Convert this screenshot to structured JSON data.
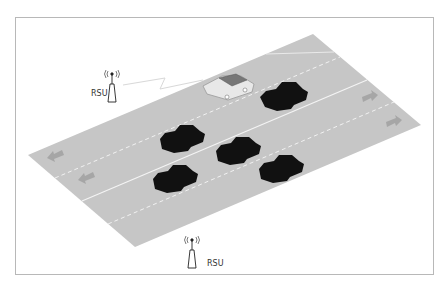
{
  "diagram": {
    "rsu_top": {
      "label": "RSU",
      "icon": "rsu-antenna-icon"
    },
    "rsu_bottom": {
      "label": "RSU",
      "icon": "rsu-antenna-icon"
    },
    "colors": {
      "road": "#c6c6c6",
      "car": "#111111",
      "frame": "#b8b8b8",
      "arrow": "#a8a8a8",
      "lane_line": "#f2f2f2"
    },
    "lanes": {
      "direction_right_arrows": 2,
      "direction_left_arrows": 2
    },
    "vehicles": {
      "highlighted_count": 1,
      "dark_count": 6
    }
  }
}
